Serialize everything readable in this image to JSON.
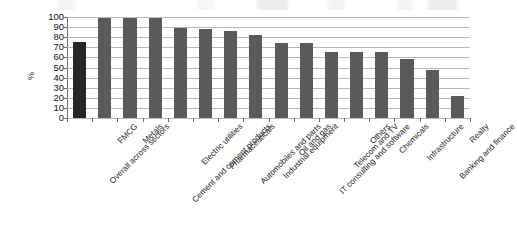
{
  "chart_data": {
    "type": "bar",
    "title": "",
    "xlabel": "",
    "ylabel": "%",
    "ylim": [
      0,
      100
    ],
    "yticks": [
      0,
      10,
      20,
      30,
      40,
      50,
      60,
      70,
      80,
      90,
      100
    ],
    "grid": true,
    "legend": "none",
    "categories": [
      "Overall across sectors",
      "FMCG",
      "Metals",
      "Cement and cement products",
      "Electric utilities",
      "Pharmaceuticals",
      "Automobiles and parts",
      "Industrial equipment",
      "Oil and gas",
      "IT consulting and software",
      "Telecom and TV",
      "Others",
      "Chemicals",
      "Infrastructure",
      "Banking and finance",
      "Realty"
    ],
    "values": [
      75,
      99,
      99,
      99,
      89,
      88,
      86,
      82,
      74,
      74,
      65,
      65,
      65,
      58,
      48,
      22
    ],
    "highlight_index": 0,
    "colors": {
      "bar": "#5a5a5a",
      "bar_highlight": "#262626",
      "grid": "#b8b8b8",
      "axis": "#6b6b6b",
      "text": "#1a1a1a"
    }
  }
}
